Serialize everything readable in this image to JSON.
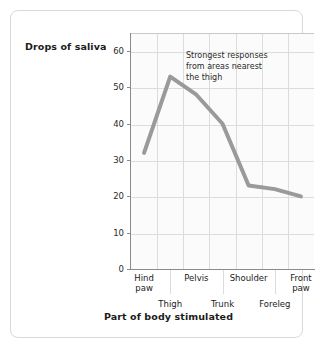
{
  "chart_data": {
    "type": "line",
    "title": "",
    "xlabel": "Part of body stimulated",
    "ylabel": "Drops of saliva",
    "categories": [
      "Hind paw",
      "Thigh",
      "Pelvis",
      "Trunk",
      "Shoulder",
      "Foreleg",
      "Front paw"
    ],
    "values": [
      32,
      53,
      48,
      40,
      23,
      22,
      20
    ],
    "ylim": [
      0,
      65
    ],
    "yticks": [
      0,
      10,
      20,
      30,
      40,
      50,
      60
    ],
    "grid": true,
    "legend": "none",
    "line_color": "#9a9a9a",
    "annotations": [
      {
        "text": "Strongest responses from areas nearest the thigh",
        "lines": [
          "Strongest responses",
          "from areas nearest",
          "the thigh"
        ]
      }
    ]
  },
  "axes": {
    "y_title": "Drops of saliva",
    "x_title": "Part of body stimulated",
    "y_tick_labels": [
      "60",
      "50",
      "40",
      "30",
      "20",
      "10",
      "0"
    ],
    "x_tick_labels_top": [
      "Hind\npaw",
      "Pelvis",
      "Shoulder",
      "Front\npaw"
    ],
    "x_tick_labels_bottom": [
      "Thigh",
      "Trunk",
      "Foreleg"
    ]
  },
  "annotation": {
    "line1": "Strongest responses",
    "line2": "from areas nearest",
    "line3": "the thigh"
  },
  "colors": {
    "line": "#9a9a9a",
    "grid": "#dcdcdc",
    "axis": "#8a8a8a",
    "card_border": "#d8d8d8",
    "plot_background": "#fbfbfb",
    "text": "#1b1b1b"
  }
}
